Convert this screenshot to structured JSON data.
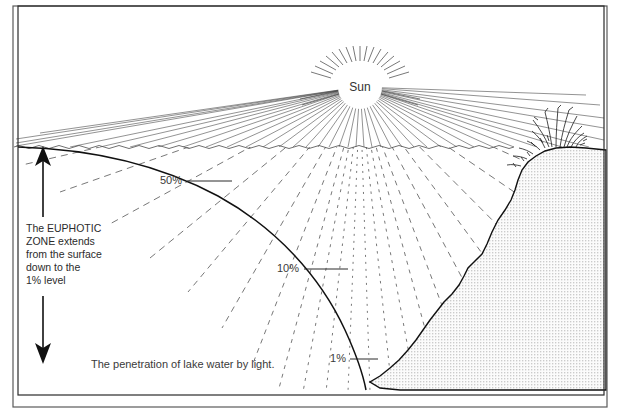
{
  "figure": {
    "title_fragment": "",
    "caption": "The penetration of lake water by light.",
    "sun_label": "Sun",
    "annotation": {
      "lines": [
        "The EUPHOTIC",
        "ZONE extends",
        "from the surface",
        "down to the",
        "1% level"
      ]
    },
    "depth_labels": [
      {
        "text": "50%",
        "x": 182,
        "y": 184,
        "leader_x1": 212,
        "leader_y1": 181,
        "leader_x2": 232,
        "leader_y2": 181
      },
      {
        "text": "10%",
        "x": 299,
        "y": 272,
        "leader_x1": 329,
        "leader_y1": 269,
        "leader_x2": 348,
        "leader_y2": 269
      },
      {
        "text": "1%",
        "x": 333,
        "y": 362,
        "leader_x1": 351,
        "leader_y1": 359,
        "leader_x2": 371,
        "leader_y2": 359
      }
    ],
    "arrows": {
      "up": {
        "label": "euphotic-zone-up-arrow",
        "x": 43,
        "y_top": 148,
        "y_bottom": 217
      },
      "down": {
        "label": "euphotic-zone-down-arrow",
        "x": 43,
        "y_top": 296,
        "y_bottom": 362
      }
    },
    "colors": {
      "ink": "#111111",
      "ray": "#4a4a4a",
      "text": "#2b2b2b",
      "sediment_fill": "#efefef",
      "frame": "#2b2b2b",
      "background": "#ffffff"
    },
    "geometry": {
      "sun_center_x": 360,
      "sun_center_y": 87,
      "sun_radius": 22,
      "water_surface_y": 146,
      "frame_left": 13,
      "frame_top": 6,
      "frame_right": 607,
      "frame_bottom": 393
    }
  }
}
